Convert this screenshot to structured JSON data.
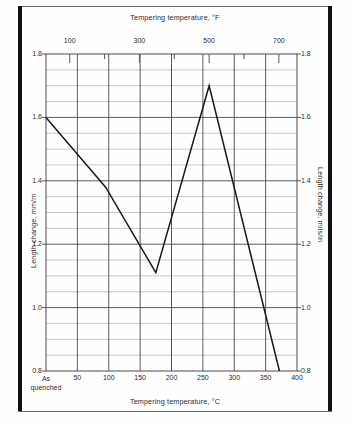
{
  "figure": {
    "top_axis_title": "Tempering temperature, °F",
    "bottom_axis_title": "Tempering temperature, °C",
    "left_axis_title": "Length change, mm/m",
    "right_axis_title": "Length change, mils/in"
  },
  "chart_data": {
    "type": "line",
    "title": "",
    "subtitle": "",
    "xlabel": "Tempering temperature, °C",
    "ylabel": "Length change, mm/m",
    "y2label": "Length change, mils/in",
    "x2label": "Tempering temperature, °F",
    "xlim": [
      0,
      400
    ],
    "ylim": [
      0.8,
      1.8
    ],
    "x2lim": [
      32,
      752
    ],
    "y2lim": [
      0.8,
      1.8
    ],
    "grid": true,
    "grid_x_step": 50,
    "grid_y_step": 0.05,
    "legend": "none",
    "x_tick_labels": [
      "As quenched",
      "50",
      "100",
      "150",
      "200",
      "250",
      "300",
      "350",
      "400"
    ],
    "x_tick_values": [
      0,
      50,
      100,
      150,
      200,
      250,
      300,
      350,
      400
    ],
    "x_first_tick_line1": "As",
    "x_first_tick_line2": "quenched",
    "x2_tick_labels": [
      "100",
      "300",
      "500",
      "700"
    ],
    "x2_tick_values": [
      100,
      300,
      500,
      700
    ],
    "y_tick_labels": [
      "1.8",
      "1.6",
      "1.4",
      "1.2",
      "1.0",
      "0.8"
    ],
    "y_tick_values": [
      1.8,
      1.6,
      1.4,
      1.2,
      1.0,
      0.8
    ],
    "y2_tick_labels": [
      "1.8",
      "1.6",
      "1.4",
      "1.2",
      "1.0",
      "0.8"
    ],
    "y2_tick_values": [
      1.8,
      1.6,
      1.4,
      1.2,
      1.0,
      0.8
    ],
    "series": [
      {
        "name": "Length change",
        "color": "#1a1a1a",
        "x": [
          0,
          95,
          175,
          260,
          372
        ],
        "values": [
          1.6,
          1.38,
          1.11,
          1.7,
          0.8
        ]
      }
    ]
  }
}
